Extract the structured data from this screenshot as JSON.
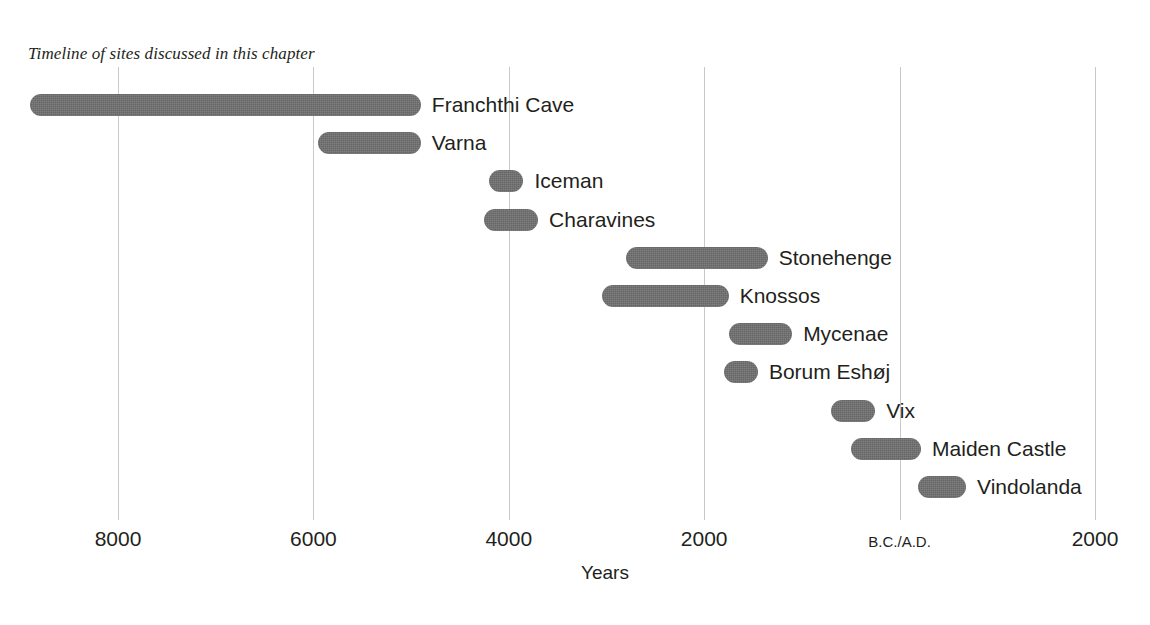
{
  "title": "Timeline of sites discussed in this chapter",
  "axis": {
    "xlabel": "Years",
    "tick_labels": [
      "8000",
      "6000",
      "4000",
      "2000",
      "B.C./A.D.",
      "2000"
    ]
  },
  "colors": {
    "bar": "#6f6f6f",
    "gridline": "#c9c9c9",
    "text": "#231f20",
    "background": "#ffffff"
  },
  "chart_data": {
    "type": "bar",
    "title": "Timeline of sites discussed in this chapter",
    "xlabel": "Years",
    "ylabel": "",
    "orientation": "horizontal",
    "subtype": "gantt-timeline",
    "grid": true,
    "legend": false,
    "x_axis": {
      "ticks": [
        -8000,
        -6000,
        -4000,
        -2000,
        0,
        2000
      ],
      "tick_labels": [
        "8000",
        "6000",
        "4000",
        "2000",
        "B.C./A.D.",
        "2000"
      ],
      "note": "Negative values are B.C., positive are A.D.",
      "xlim": [
        -8900,
        2250
      ]
    },
    "categories": [
      "Franchthi Cave",
      "Varna",
      "Iceman",
      "Charavines",
      "Stonehenge",
      "Knossos",
      "Mycenae",
      "Borum Eshøj",
      "Vix",
      "Maiden Castle",
      "Vindolanda"
    ],
    "bars": [
      {
        "label": "Franchthi Cave",
        "start": -8900,
        "end": -4900
      },
      {
        "label": "Varna",
        "start": -5950,
        "end": -4900
      },
      {
        "label": "Iceman",
        "start": -4200,
        "end": -3850
      },
      {
        "label": "Charavines",
        "start": -4250,
        "end": -3700
      },
      {
        "label": "Stonehenge",
        "start": -2800,
        "end": -1350
      },
      {
        "label": "Knossos",
        "start": -3050,
        "end": -1750
      },
      {
        "label": "Mycenae",
        "start": -1750,
        "end": -1100
      },
      {
        "label": "Borum Eshøj",
        "start": -1800,
        "end": -1450
      },
      {
        "label": "Vix",
        "start": -700,
        "end": -250
      },
      {
        "label": "Maiden Castle",
        "start": -500,
        "end": 220
      },
      {
        "label": "Vindolanda",
        "start": 190,
        "end": 680
      }
    ]
  }
}
